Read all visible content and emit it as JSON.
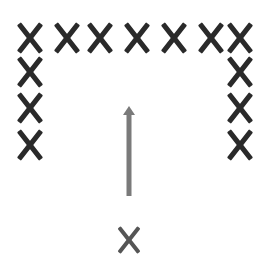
{
  "diagram": {
    "colors": {
      "mark": "#2a2a2a",
      "bottom_mark": "#555555",
      "arrow": "#7a7a7a",
      "background": "#ffffff"
    },
    "marks": [
      {
        "id": "top-1",
        "x": 30,
        "y": 38
      },
      {
        "id": "top-2",
        "x": 67,
        "y": 38
      },
      {
        "id": "top-3",
        "x": 100,
        "y": 38
      },
      {
        "id": "top-4",
        "x": 137,
        "y": 38
      },
      {
        "id": "top-5",
        "x": 174,
        "y": 38
      },
      {
        "id": "top-6",
        "x": 211,
        "y": 38
      },
      {
        "id": "top-7",
        "x": 240,
        "y": 38
      },
      {
        "id": "left-2",
        "x": 30,
        "y": 72
      },
      {
        "id": "left-3",
        "x": 30,
        "y": 108
      },
      {
        "id": "left-4",
        "x": 30,
        "y": 145
      },
      {
        "id": "right-2",
        "x": 240,
        "y": 72
      },
      {
        "id": "right-3",
        "x": 240,
        "y": 108
      },
      {
        "id": "right-4",
        "x": 240,
        "y": 145
      }
    ],
    "bottom_mark": {
      "id": "bottom",
      "x": 129,
      "y": 240
    },
    "arrow": {
      "x": 129,
      "y_start": 196,
      "y_end": 106,
      "direction": "up"
    }
  }
}
